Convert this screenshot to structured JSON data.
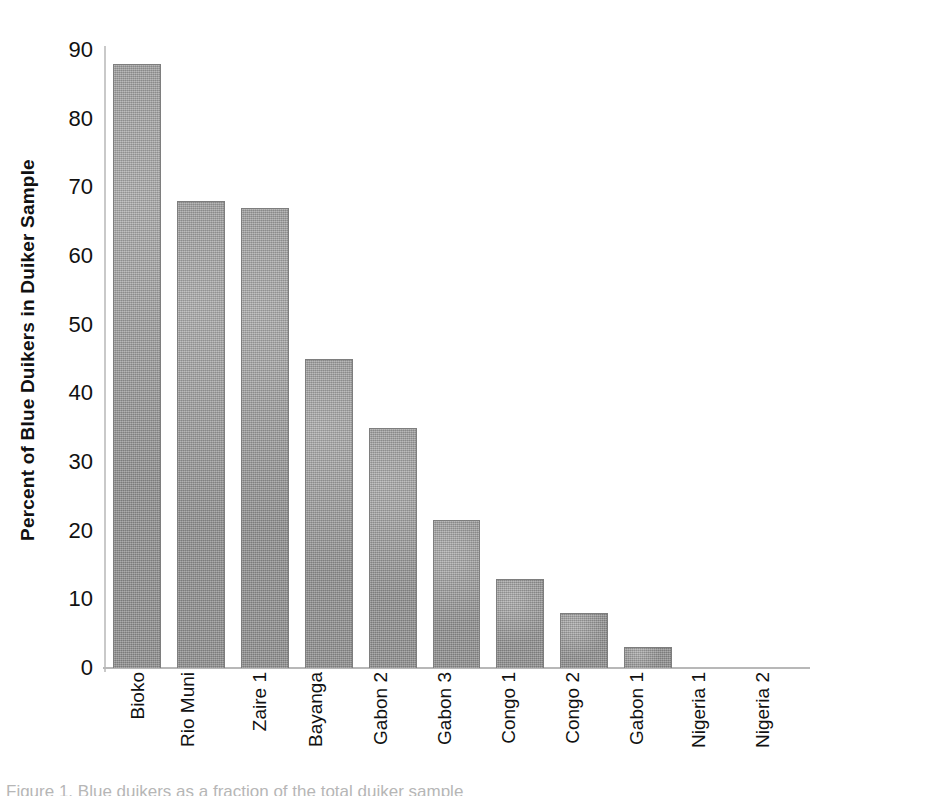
{
  "chart_data": {
    "type": "bar",
    "title": "",
    "xlabel": "",
    "ylabel": "Percent of Blue Duikers in  Duiker Sample",
    "categories": [
      "Bioko",
      "Rio Muni",
      "Zaire 1",
      "Bayanga",
      "Gabon 2",
      "Gabon 3",
      "Congo 1",
      "Congo 2",
      "Gabon 1",
      "Nigeria 1",
      "Nigeria 2"
    ],
    "values": [
      88,
      68,
      67,
      45,
      35,
      21.5,
      13,
      8,
      3,
      0,
      0
    ],
    "ylim": [
      0,
      90
    ],
    "yticks": [
      0,
      10,
      20,
      30,
      40,
      50,
      60,
      70,
      80,
      90
    ],
    "ytick_labels": [
      "0",
      "10",
      "20",
      "30",
      "40",
      "50",
      "60",
      "70",
      "80",
      "90"
    ],
    "grid": false,
    "legend": null,
    "bar_color": "#9d9d9d",
    "bar_border_color": "#7e7e7e",
    "axis_color": "#b8b8b8"
  },
  "caption": {
    "text": "Figure 1. Blue duikers as a fraction of the total duiker sample"
  }
}
